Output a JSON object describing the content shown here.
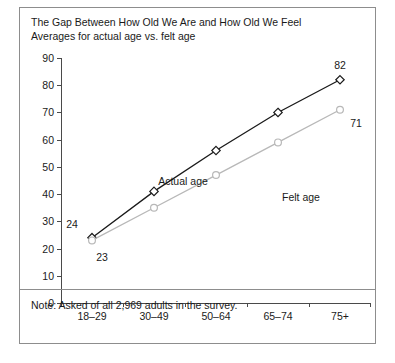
{
  "chart_data": {
    "type": "line",
    "title": "The Gap Between How Old We Are and How Old We Feel",
    "subtitle": "Averages for actual age vs. felt age",
    "xlabel": "",
    "ylabel": "",
    "categories": [
      "18–29",
      "30–49",
      "50–64",
      "65–74",
      "75+"
    ],
    "series": [
      {
        "name": "Actual age",
        "color": "#1a1a1a",
        "marker": "diamond",
        "values": [
          24,
          41,
          56,
          70,
          82
        ],
        "point_labels": [
          "24",
          "",
          "",
          "",
          "82"
        ]
      },
      {
        "name": "Felt age",
        "color": "#b8b8b8",
        "marker": "circle",
        "values": [
          23,
          35,
          47,
          59,
          71
        ],
        "point_labels": [
          "23",
          "",
          "",
          "",
          "71"
        ]
      }
    ],
    "ylim": [
      0,
      90
    ],
    "yticks": [
      0,
      10,
      20,
      30,
      40,
      50,
      60,
      70,
      80,
      90
    ],
    "ytick_labels": [
      "0",
      "10",
      "20",
      "30",
      "40",
      "50",
      "60",
      "70",
      "80",
      "90"
    ],
    "grid": false,
    "legend": "inline-annotations",
    "note": "Note: Asked of all 2,969 adults in the survey."
  },
  "annotations": {
    "actual_age_label": "Actual age",
    "felt_age_label": "Felt age"
  }
}
